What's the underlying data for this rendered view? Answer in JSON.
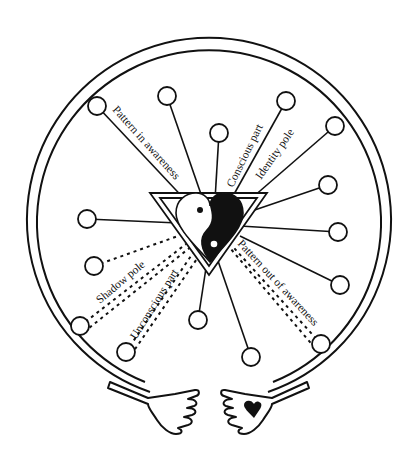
{
  "diagram": {
    "colors": {
      "ink": "#111111",
      "paper": "#ffffff"
    },
    "labels": {
      "pattern_in_awareness": "Pattern in awareness",
      "conscious_part": "Conscious part",
      "identity_pole": "Identity pole",
      "pattern_out_of_awareness": "Pattern out of awareness",
      "shadow_pole": "Shadow pole",
      "unconscious_part": "Unconscious part"
    },
    "center": {
      "shape": "yin-yang heart inside inverted triangle"
    },
    "outer_ring": {
      "shape": "double circle held by two hands"
    },
    "hands": {
      "left": "open hand",
      "right": "open hand with small heart in palm"
    },
    "nodes": {
      "solid": [
        {
          "x": 97,
          "y": 106
        },
        {
          "x": 167,
          "y": 96
        },
        {
          "x": 219,
          "y": 133
        },
        {
          "x": 286,
          "y": 101
        },
        {
          "x": 335,
          "y": 126
        },
        {
          "x": 328,
          "y": 185
        },
        {
          "x": 338,
          "y": 232
        },
        {
          "x": 340,
          "y": 285
        },
        {
          "x": 87,
          "y": 219
        },
        {
          "x": 198,
          "y": 320
        },
        {
          "x": 251,
          "y": 357
        }
      ],
      "dashed": [
        {
          "x": 94,
          "y": 266
        },
        {
          "x": 80,
          "y": 326
        },
        {
          "x": 126,
          "y": 352
        },
        {
          "x": 321,
          "y": 344
        }
      ]
    }
  }
}
